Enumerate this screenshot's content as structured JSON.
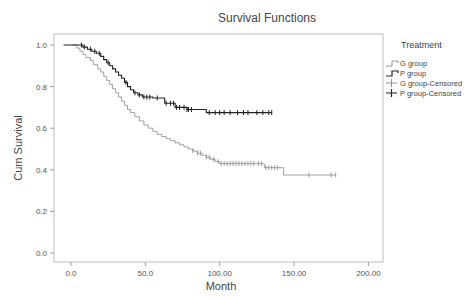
{
  "chart_data": {
    "type": "line",
    "subtype": "kaplan-meier step",
    "title": "Survival Functions",
    "xlabel": "Month",
    "ylabel": "Cum Survival",
    "xlim": [
      -10,
      210
    ],
    "ylim": [
      -0.05,
      1.05
    ],
    "x_ticks": [
      "0.0",
      "50.0",
      "100.00",
      "150.00",
      "200.00"
    ],
    "x_tick_values": [
      0,
      50,
      100,
      150,
      200
    ],
    "y_ticks": [
      "0.0",
      "0.2",
      "0.4",
      "0.6",
      "0.8",
      "1.0"
    ],
    "y_tick_values": [
      0,
      0.2,
      0.4,
      0.6,
      0.8,
      1.0
    ],
    "grid": false,
    "legend_title": "Treatment",
    "legend_position": "right",
    "legend": [
      "G group",
      "P group",
      "G group-Censored",
      "P group-Censored"
    ],
    "series": [
      {
        "name": "G group",
        "color": "#8a8a8a",
        "steps": [
          [
            1,
            1.0
          ],
          [
            4,
            0.985
          ],
          [
            6,
            0.97
          ],
          [
            8,
            0.955
          ],
          [
            10,
            0.94
          ],
          [
            13,
            0.925
          ],
          [
            15,
            0.905
          ],
          [
            18,
            0.885
          ],
          [
            20,
            0.87
          ],
          [
            22,
            0.85
          ],
          [
            24,
            0.83
          ],
          [
            26,
            0.81
          ],
          [
            28,
            0.79
          ],
          [
            30,
            0.77
          ],
          [
            32,
            0.75
          ],
          [
            34,
            0.73
          ],
          [
            36,
            0.71
          ],
          [
            38,
            0.69
          ],
          [
            40,
            0.675
          ],
          [
            43,
            0.655
          ],
          [
            46,
            0.635
          ],
          [
            49,
            0.615
          ],
          [
            52,
            0.6
          ],
          [
            55,
            0.585
          ],
          [
            58,
            0.57
          ],
          [
            61,
            0.56
          ],
          [
            64,
            0.55
          ],
          [
            67,
            0.54
          ],
          [
            70,
            0.53
          ],
          [
            73,
            0.52
          ],
          [
            76,
            0.51
          ],
          [
            79,
            0.5
          ],
          [
            82,
            0.49
          ],
          [
            85,
            0.48
          ],
          [
            88,
            0.47
          ],
          [
            91,
            0.46
          ],
          [
            94,
            0.45
          ],
          [
            97,
            0.44
          ],
          [
            100,
            0.43
          ],
          [
            130,
            0.41
          ],
          [
            143,
            0.375
          ],
          [
            178,
            0.375
          ]
        ],
        "censored": [
          82,
          85,
          87,
          91,
          93,
          96,
          99,
          101,
          103,
          105,
          107,
          109,
          111,
          113,
          115,
          117,
          119,
          121,
          123,
          126,
          128,
          131,
          133,
          135,
          137,
          139,
          160,
          175,
          178
        ]
      },
      {
        "name": "P group",
        "color": "#222222",
        "steps": [
          [
            -5,
            1.0
          ],
          [
            8,
            0.99
          ],
          [
            11,
            0.98
          ],
          [
            14,
            0.97
          ],
          [
            17,
            0.96
          ],
          [
            20,
            0.945
          ],
          [
            22,
            0.93
          ],
          [
            24,
            0.915
          ],
          [
            26,
            0.9
          ],
          [
            28,
            0.885
          ],
          [
            30,
            0.87
          ],
          [
            32,
            0.855
          ],
          [
            34,
            0.84
          ],
          [
            36,
            0.82
          ],
          [
            38,
            0.8
          ],
          [
            40,
            0.785
          ],
          [
            42,
            0.77
          ],
          [
            45,
            0.76
          ],
          [
            48,
            0.75
          ],
          [
            55,
            0.745
          ],
          [
            63,
            0.72
          ],
          [
            70,
            0.7
          ],
          [
            78,
            0.69
          ],
          [
            91,
            0.675
          ],
          [
            135,
            0.675
          ]
        ],
        "censored": [
          7,
          9,
          13,
          16,
          19,
          25,
          37,
          43,
          46,
          49,
          51,
          53,
          58,
          64,
          67,
          69,
          71,
          73,
          76,
          78,
          79,
          81,
          93,
          97,
          100,
          103,
          107,
          112,
          116,
          119,
          125,
          129,
          133,
          135
        ]
      }
    ]
  }
}
